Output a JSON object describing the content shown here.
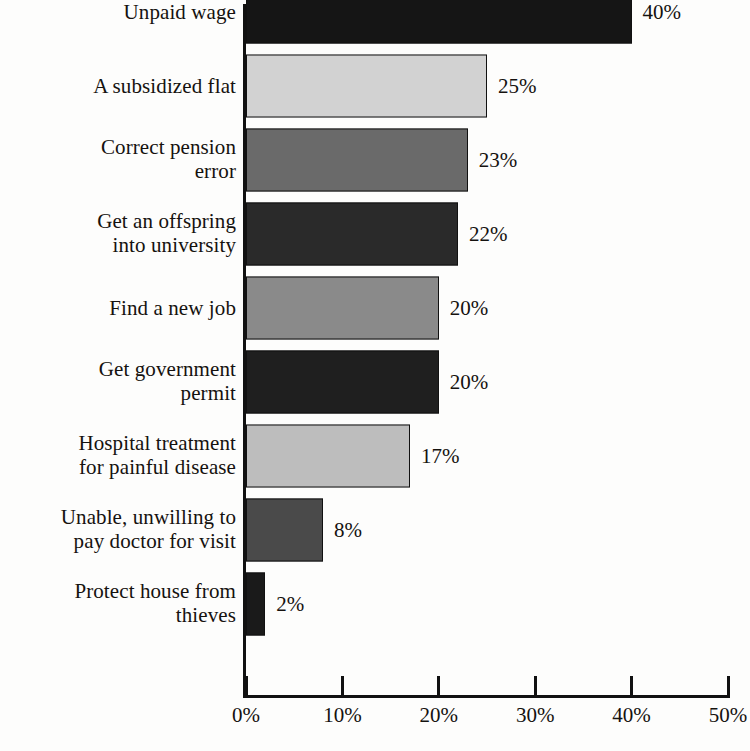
{
  "chart_data": {
    "type": "bar",
    "orientation": "horizontal",
    "title": "",
    "subtitle": "",
    "xlabel": "",
    "ylabel": "",
    "xlim": [
      0,
      50
    ],
    "xticks": [
      "0%",
      "10%",
      "20%",
      "30%",
      "40%",
      "50%"
    ],
    "xtick_values": [
      0,
      10,
      20,
      30,
      40,
      50
    ],
    "grid": false,
    "legend": "none",
    "categories": [
      "Unpaid wage",
      "A subsidized flat",
      "Correct pension\nerror",
      "Get an offspring\ninto university",
      "Find a new job",
      "Get government\npermit",
      "Hospital treatment\nfor painful disease",
      "Unable, unwilling to\npay doctor for visit",
      "Protect house from\nthieves"
    ],
    "values": [
      40,
      25,
      23,
      22,
      20,
      20,
      17,
      8,
      2
    ],
    "value_labels": [
      "40%",
      "25%",
      "23%",
      "22%",
      "20%",
      "20%",
      "17%",
      "8%",
      "2%"
    ],
    "bar_colors": [
      "#151515",
      "#d2d2d2",
      "#6a6a6a",
      "#2a2a2a",
      "#8a8a8a",
      "#1f1f1f",
      "#bdbdbd",
      "#4a4a4a",
      "#1a1a1a"
    ],
    "bar_edge_color": "#111111",
    "axis_color": "#111111",
    "background_color": "#fdfdfc",
    "text_color": "#15120f"
  }
}
